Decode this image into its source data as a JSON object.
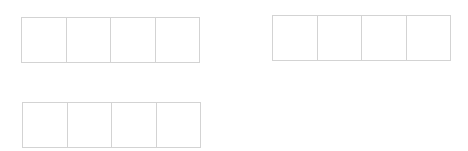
{
  "groups": [
    {
      "cells": [
        "",
        "",
        "",
        ""
      ]
    },
    {
      "cells": [
        "",
        "",
        "",
        ""
      ]
    },
    {
      "cells": [
        "",
        "",
        "",
        ""
      ]
    }
  ],
  "colors": {
    "border": "#d3d3d3",
    "background": "#ffffff"
  }
}
